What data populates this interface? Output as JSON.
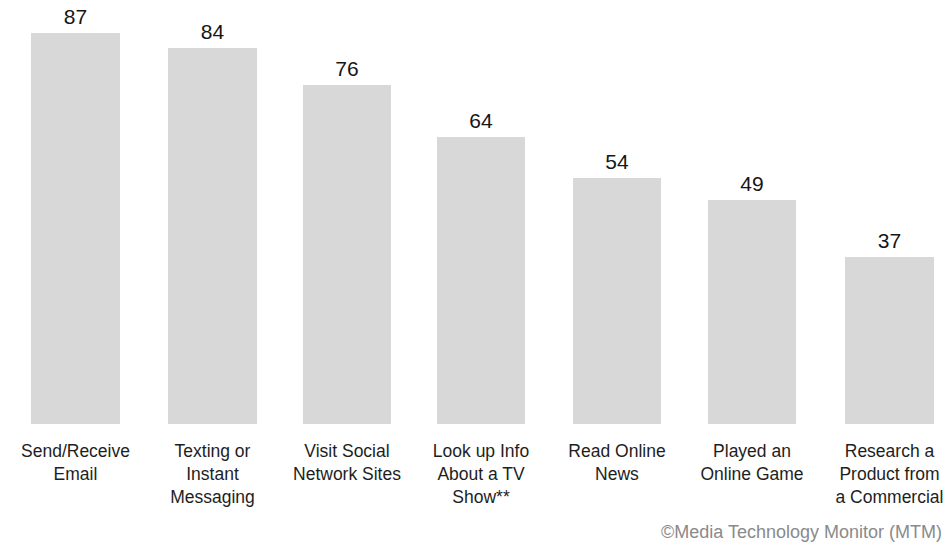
{
  "chart_data": {
    "type": "bar",
    "title": "",
    "subtitle": "",
    "xlabel": "",
    "ylabel": "",
    "ylim": [
      0,
      100
    ],
    "grid": false,
    "legend": null,
    "orientation": "vertical",
    "bar_color": "#d8d8d8",
    "background_color": "#ffffff",
    "value_label_color": "#161616",
    "category_label_color": "#1e1e1e",
    "categories": [
      "Send/Receive Email",
      "Texting or Instant Messaging",
      "Visit Social Network Sites",
      "Look up Info About a TV Show**",
      "Read Online News",
      "Played an Online Game",
      "Research a Product from a Commercial"
    ],
    "values": [
      87,
      84,
      76,
      64,
      54,
      49,
      37
    ],
    "value_labels": [
      "87",
      "84",
      "76",
      "64",
      "54",
      "49",
      "37"
    ],
    "annotations": [
      "©Media Technology Monitor (MTM)"
    ],
    "footnote_marker": "**"
  },
  "bars": [
    {
      "label_lines": [
        "Send/Receive",
        "Email"
      ],
      "value_label": "87",
      "value": 87,
      "left": 31,
      "width": 89,
      "top": 33,
      "height": 391
    },
    {
      "label_lines": [
        "Texting or",
        "Instant",
        "Messaging"
      ],
      "value_label": "84",
      "value": 84,
      "left": 168,
      "width": 89,
      "top": 48,
      "height": 376
    },
    {
      "label_lines": [
        "Visit Social",
        "Network Sites"
      ],
      "value_label": "76",
      "value": 76,
      "left": 303,
      "width": 88,
      "top": 85,
      "height": 339
    },
    {
      "label_lines": [
        "Look up Info",
        "About a TV",
        "Show**"
      ],
      "value_label": "64",
      "value": 64,
      "left": 437,
      "width": 88,
      "top": 137,
      "height": 287
    },
    {
      "label_lines": [
        "Read Online",
        "News"
      ],
      "value_label": "54",
      "value": 54,
      "left": 573,
      "width": 88,
      "top": 178,
      "height": 246
    },
    {
      "label_lines": [
        "Played an",
        "Online Game"
      ],
      "value_label": "49",
      "value": 49,
      "left": 708,
      "width": 88,
      "top": 200,
      "height": 224
    },
    {
      "label_lines": [
        "Research a",
        "Product from",
        "a Commercial"
      ],
      "value_label": "37",
      "value": 37,
      "left": 845,
      "width": 89,
      "top": 257,
      "height": 167
    }
  ],
  "attribution": {
    "text": "©Media Technology Monitor (MTM)"
  },
  "layout": {
    "baseline_y": 424,
    "label_top_y": 440,
    "value_label_offset": 27
  }
}
